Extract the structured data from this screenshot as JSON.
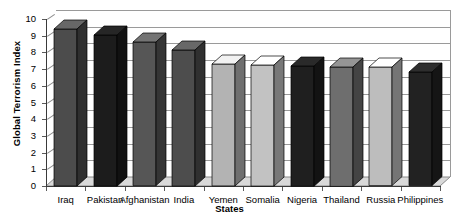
{
  "chart_data": {
    "type": "bar",
    "title": "",
    "xlabel": "States",
    "ylabel": "Global Terrorism Index",
    "ylim": [
      0,
      10
    ],
    "ytick_labels": [
      "0",
      "1",
      "2",
      "3",
      "4",
      "5",
      "6",
      "7",
      "8",
      "9",
      "10"
    ],
    "grid": true,
    "legend": "none",
    "style": "3d-column",
    "categories": [
      "Iraq",
      "Pakistan",
      "Afghanistan",
      "India",
      "Yemen",
      "Somalia",
      "Nigeria",
      "Thailand",
      "Russia",
      "Philippines"
    ],
    "values": [
      9.4,
      9.05,
      8.6,
      8.15,
      7.3,
      7.25,
      7.2,
      7.15,
      7.1,
      6.8
    ],
    "bar_colors": [
      "#4c4c4c",
      "#1c1c1c",
      "#565656",
      "#4d4d4d",
      "#b3b3b3",
      "#c2c2c2",
      "#1f1f1f",
      "#6e6e6e",
      "#bdbdbd",
      "#222222"
    ]
  },
  "axes": {
    "y_title": "Global Terrorism Index",
    "x_title": "States"
  }
}
